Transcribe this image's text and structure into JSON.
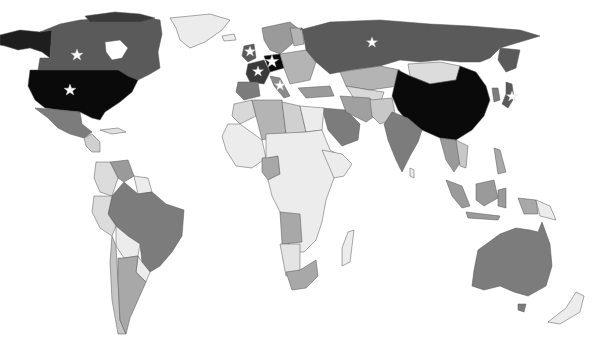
{
  "map": {
    "type": "choropleth",
    "projection": "equirectangular-like world map",
    "color_scale": {
      "level_1_highest": "#0a0a0a",
      "level_2": "#5a5a5a",
      "level_3": "#7c7c7c",
      "level_4": "#b4b4b4",
      "level_5_lowest": "#ececec",
      "no_data_ocean": "#ffffff"
    },
    "regions": [
      {
        "name": "United States",
        "level": 1
      },
      {
        "name": "China",
        "level": 1
      },
      {
        "name": "Canada",
        "level": 2
      },
      {
        "name": "Alaska",
        "level": 1
      },
      {
        "name": "Russia",
        "level": 2
      },
      {
        "name": "Germany",
        "level": 1
      },
      {
        "name": "France",
        "level": 2
      },
      {
        "name": "United Kingdom",
        "level": 2
      },
      {
        "name": "Japan",
        "level": 2
      },
      {
        "name": "India",
        "level": 3
      },
      {
        "name": "Brazil",
        "level": 3
      },
      {
        "name": "Mexico",
        "level": 3
      },
      {
        "name": "Australia",
        "level": 3
      },
      {
        "name": "Saudi Arabia",
        "level": 3
      },
      {
        "name": "Spain",
        "level": 3
      },
      {
        "name": "Italy",
        "level": 3
      },
      {
        "name": "Argentina",
        "level": 4
      },
      {
        "name": "Kazakhstan",
        "level": 4
      },
      {
        "name": "South Africa",
        "level": 4
      },
      {
        "name": "Nigeria",
        "level": 4
      },
      {
        "name": "Angola",
        "level": 4
      },
      {
        "name": "Indonesia",
        "level": 4
      },
      {
        "name": "Iran",
        "level": 4
      },
      {
        "name": "Mongolia",
        "level": 5
      },
      {
        "name": "Greenland",
        "level": 5
      },
      {
        "name": "Africa (most)",
        "level": 5
      },
      {
        "name": "Peru",
        "level": 5
      },
      {
        "name": "Bolivia",
        "level": 5
      },
      {
        "name": "New Zealand",
        "level": 5
      }
    ],
    "stars": [
      {
        "label": "Canada",
        "x": 77,
        "y": 55
      },
      {
        "label": "United States",
        "x": 70,
        "y": 90
      },
      {
        "label": "United Kingdom",
        "x": 250,
        "y": 52
      },
      {
        "label": "Germany",
        "x": 272,
        "y": 62
      },
      {
        "label": "France",
        "x": 258,
        "y": 72
      },
      {
        "label": "Italy",
        "x": 280,
        "y": 86
      },
      {
        "label": "Russia",
        "x": 372,
        "y": 43
      },
      {
        "label": "Japan",
        "x": 512,
        "y": 97
      }
    ]
  }
}
